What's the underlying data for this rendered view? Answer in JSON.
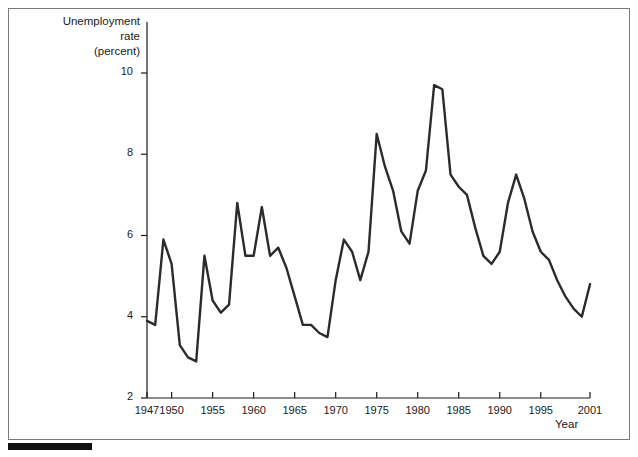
{
  "figure": {
    "background_color": "#ffffff",
    "border_color": "#7b7b7b",
    "line_color": "#2b2b2b",
    "axis_color": "#1a1a1a",
    "bottom_bar_color": "#111111"
  },
  "labels": {
    "ylabel_line1": "Unemployment",
    "ylabel_line2": "rate",
    "ylabel_line3": "(percent)",
    "xlabel": "Year"
  },
  "chart_data": {
    "type": "line",
    "title": "",
    "xlabel": "Year",
    "ylabel": "Unemployment rate (percent)",
    "xlim": [
      1947,
      2001
    ],
    "ylim": [
      2,
      10
    ],
    "xticks": [
      1947,
      1950,
      1955,
      1960,
      1965,
      1970,
      1975,
      1980,
      1985,
      1990,
      1995,
      2001
    ],
    "xtick_labels": [
      "1947",
      "1950",
      "1955",
      "1960",
      "1965",
      "1970",
      "1975",
      "1980",
      "1985",
      "1990",
      "1995",
      "2001"
    ],
    "yticks": [
      2,
      4,
      6,
      8,
      10
    ],
    "ytick_labels": [
      "2",
      "4",
      "6",
      "8",
      "10"
    ],
    "grid": false,
    "legend": false,
    "series": [
      {
        "name": "Unemployment rate",
        "x": [
          1947,
          1948,
          1949,
          1950,
          1951,
          1952,
          1953,
          1954,
          1955,
          1956,
          1957,
          1958,
          1959,
          1960,
          1961,
          1962,
          1963,
          1964,
          1965,
          1966,
          1967,
          1968,
          1969,
          1970,
          1971,
          1972,
          1973,
          1974,
          1975,
          1976,
          1977,
          1978,
          1979,
          1980,
          1981,
          1982,
          1983,
          1984,
          1985,
          1986,
          1987,
          1988,
          1989,
          1990,
          1991,
          1992,
          1993,
          1994,
          1995,
          1996,
          1997,
          1998,
          1999,
          2000,
          2001
        ],
        "values": [
          3.9,
          3.8,
          5.9,
          5.3,
          3.3,
          3.0,
          2.9,
          5.5,
          4.4,
          4.1,
          4.3,
          6.8,
          5.5,
          5.5,
          6.7,
          5.5,
          5.7,
          5.2,
          4.5,
          3.8,
          3.8,
          3.6,
          3.5,
          4.9,
          5.9,
          5.6,
          4.9,
          5.6,
          8.5,
          7.7,
          7.1,
          6.1,
          5.8,
          7.1,
          7.6,
          9.7,
          9.6,
          7.5,
          7.2,
          7.0,
          6.2,
          5.5,
          5.3,
          5.6,
          6.8,
          7.5,
          6.9,
          6.1,
          5.6,
          5.4,
          4.9,
          4.5,
          4.2,
          4.0,
          4.8
        ]
      }
    ]
  }
}
